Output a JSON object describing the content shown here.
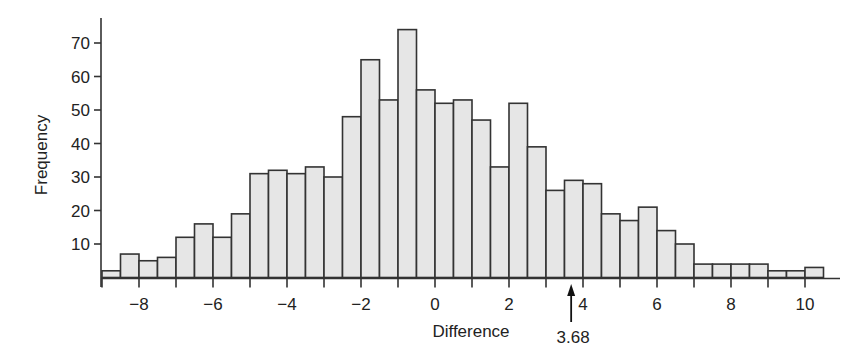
{
  "chart_data": {
    "type": "bar",
    "subtype": "histogram",
    "title": "",
    "xlabel": "Difference",
    "ylabel": "Frequency",
    "bin_width": 0.5,
    "bin_starts": [
      -9,
      -8.5,
      -8,
      -7.5,
      -7,
      -6.5,
      -6,
      -5.5,
      -5,
      -4.5,
      -4,
      -3.5,
      -3,
      -2.5,
      -2,
      -1.5,
      -1,
      -0.5,
      0,
      0.5,
      1,
      1.5,
      2,
      2.5,
      3,
      3.5,
      4,
      4.5,
      5,
      5.5,
      6,
      6.5,
      7,
      7.5,
      8,
      8.5,
      9,
      9.5,
      10
    ],
    "values": [
      2,
      7,
      5,
      6,
      12,
      16,
      12,
      19,
      31,
      32,
      31,
      33,
      30,
      48,
      65,
      53,
      74,
      56,
      52,
      53,
      47,
      33,
      52,
      39,
      26,
      29,
      28,
      19,
      17,
      21,
      14,
      10,
      4,
      4,
      4,
      4,
      2,
      2,
      3
    ],
    "xlim": [
      -9,
      10.5
    ],
    "ylim": [
      0,
      77
    ],
    "x_ticks": [
      -8,
      -6,
      -4,
      -2,
      0,
      2,
      4,
      6,
      8,
      10
    ],
    "x_tick_labels": [
      "−8",
      "−6",
      "−4",
      "−2",
      "0",
      "2",
      "4",
      "6",
      "8",
      "10"
    ],
    "y_ticks": [
      10,
      20,
      30,
      40,
      50,
      60,
      70
    ],
    "y_tick_labels": [
      "10",
      "20",
      "30",
      "40",
      "50",
      "60",
      "70"
    ],
    "grid": false,
    "legend": null,
    "annotations": [
      {
        "type": "arrow",
        "x": 3.68,
        "direction": "up",
        "label": "3.68"
      }
    ],
    "colors": {
      "bar_fill": "#e6e6e6",
      "bar_edge": "#333333"
    }
  }
}
